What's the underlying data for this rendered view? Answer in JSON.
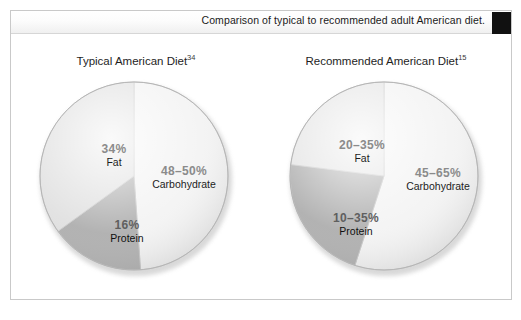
{
  "header": {
    "caption": "Comparison of typical to recommended adult American diet.",
    "marker_color": "#111111"
  },
  "charts": [
    {
      "id": "typical",
      "title": "Typical American Diet",
      "reference": "34",
      "slices": [
        {
          "name": "Carbohydrate",
          "percent_label": "48–50%",
          "value": 49,
          "color": "#f2f2f2",
          "start_deg": 0,
          "end_deg": 176
        },
        {
          "name": "Protein",
          "percent_label": "16%",
          "value": 16,
          "color": "#a8a8a8",
          "start_deg": 176,
          "end_deg": 234
        },
        {
          "name": "Fat",
          "percent_label": "34%",
          "value": 35,
          "color": "#dedede",
          "start_deg": 234,
          "end_deg": 360
        }
      ]
    },
    {
      "id": "recommended",
      "title": "Recommended American Diet",
      "reference": "15",
      "slices": [
        {
          "name": "Carbohydrate",
          "percent_label": "45–65%",
          "value": 55,
          "color": "#f2f2f2",
          "start_deg": 0,
          "end_deg": 198
        },
        {
          "name": "Protein",
          "percent_label": "10–35%",
          "value": 22,
          "color": "#a8a8a8",
          "start_deg": 198,
          "end_deg": 277
        },
        {
          "name": "Fat",
          "percent_label": "20–35%",
          "value": 28,
          "color": "#e2e2e2",
          "start_deg": 277,
          "end_deg": 360
        }
      ]
    }
  ],
  "chart_data": {
    "type": "pie",
    "title": "Comparison of typical to recommended adult American diet.",
    "legend": "none",
    "charts": [
      {
        "title": "Typical American Diet",
        "reference": "34",
        "categories": [
          "Carbohydrate",
          "Fat",
          "Protein"
        ],
        "value_labels": [
          "48–50%",
          "34%",
          "16%"
        ],
        "values": [
          49,
          34,
          16
        ],
        "units": "percent of total calories"
      },
      {
        "title": "Recommended American Diet",
        "reference": "15",
        "categories": [
          "Carbohydrate",
          "Fat",
          "Protein"
        ],
        "value_labels": [
          "45–65%",
          "20–35%",
          "10–35%"
        ],
        "values": [
          55,
          28,
          22
        ],
        "ranges": [
          [
            45,
            65
          ],
          [
            20,
            35
          ],
          [
            10,
            35
          ]
        ],
        "units": "percent of total calories"
      }
    ]
  },
  "labels": {
    "typical": {
      "fat": {
        "pct": "34%",
        "name": "Fat",
        "x": 42,
        "y": 62
      },
      "carbohydrate": {
        "pct": "48–50%",
        "name": "Carbohydrate",
        "x": 118,
        "y": 84
      },
      "protein": {
        "pct": "16%",
        "name": "Protein",
        "x": 70,
        "y": 140
      }
    },
    "recommended": {
      "fat": {
        "pct": "20–35%",
        "name": "Fat",
        "x": 38,
        "y": 58
      },
      "carbohydrate": {
        "pct": "45–65%",
        "name": "Carbohydrate",
        "x": 122,
        "y": 86
      },
      "protein": {
        "pct": "10–35%",
        "name": "Protein",
        "x": 40,
        "y": 133
      }
    }
  }
}
